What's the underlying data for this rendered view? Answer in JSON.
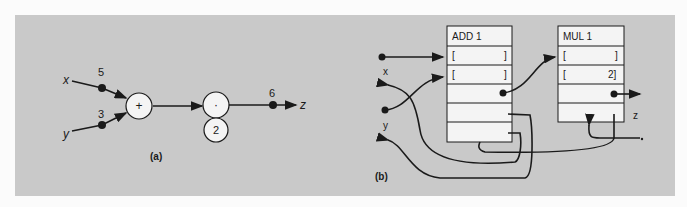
{
  "figure_a": {
    "label": "(a)",
    "inputs": [
      {
        "name": "x",
        "value": "5"
      },
      {
        "name": "y",
        "value": "3"
      }
    ],
    "add_node": "+",
    "mul_node": "·",
    "constant": "2",
    "output": {
      "name": "z",
      "value": "6"
    }
  },
  "figure_b": {
    "label": "(b)",
    "add_block": {
      "title": "ADD 1",
      "rows": [
        "[",
        "]",
        "[",
        "]"
      ]
    },
    "mul_block": {
      "title": "MUL 1",
      "rows": [
        "[",
        "]",
        "[",
        "2]"
      ]
    },
    "labels": {
      "x": "x",
      "y": "y",
      "z": "z"
    }
  },
  "colors": {
    "background": "#c9c9c9",
    "ink": "#1a1a1a",
    "box": "#f4f4f4"
  }
}
